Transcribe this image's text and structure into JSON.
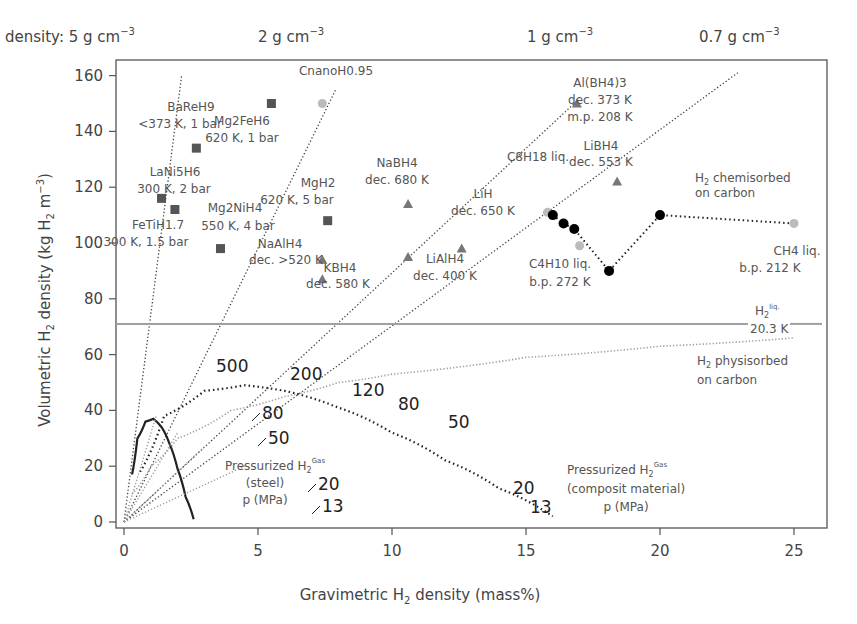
{
  "chart_data": {
    "type": "scatter",
    "title": "",
    "xlabel": "Gravimetric H2 density (mass%)",
    "ylabel": "Volumetric H2 density (kg H2 m-3)",
    "xlim": [
      0,
      26
    ],
    "ylim": [
      0,
      160
    ],
    "xticks": [
      0,
      5,
      10,
      15,
      20,
      25
    ],
    "yticks": [
      0,
      20,
      40,
      60,
      80,
      100,
      120,
      140,
      160
    ],
    "grid": false,
    "top_density_labels": [
      {
        "label": "density: 5 g cm",
        "sup": "−3",
        "x": 1.0
      },
      {
        "label": "2 g cm",
        "sup": "−3",
        "x": 7.8
      },
      {
        "label": "1 g cm",
        "sup": "−3",
        "x": 16.5
      },
      {
        "label": "0.7 g cm",
        "sup": "−3",
        "x": 23.5
      }
    ],
    "density_lines": [
      {
        "density": 5,
        "x_end": 2.15,
        "y_end": 160
      },
      {
        "density": 2,
        "x_end": 7.9,
        "y_end": 155
      },
      {
        "density": 1,
        "x_end": 16.8,
        "y_end": 150
      },
      {
        "density": 0.7,
        "x_end": 22.9,
        "y_end": 161
      }
    ],
    "series": [
      {
        "name": "Metal hydrides",
        "marker": "square",
        "color": "#555555",
        "points": [
          {
            "label": "BaReH9",
            "sub": "<373 K, 1 bar",
            "x": 2.7,
            "y": 134
          },
          {
            "label": "Mg2FeH6",
            "sub": "620 K, 1 bar",
            "x": 5.5,
            "y": 150
          },
          {
            "label": "LaNi5H6",
            "sub": "300 K, 2 bar",
            "x": 1.4,
            "y": 116
          },
          {
            "label": "FeTiH1.7",
            "sub": "300 K, 1.5 bar",
            "x": 1.9,
            "y": 112
          },
          {
            "label": "Mg2NiH4",
            "sub": "550 K, 4 bar",
            "x": 3.6,
            "y": 98
          },
          {
            "label": "MgH2",
            "sub": "620 K, 5 bar",
            "x": 7.6,
            "y": 108
          }
        ]
      },
      {
        "name": "Complex hydrides",
        "marker": "triangle",
        "color": "#777777",
        "points": [
          {
            "label": "Al(BH4)3",
            "sub": "dec. 373 K / m.p. 208 K",
            "x": 16.9,
            "y": 150
          },
          {
            "label": "LiBH4",
            "sub": "dec. 553 K",
            "x": 18.4,
            "y": 122
          },
          {
            "label": "NaBH4",
            "sub": "dec. 680 K",
            "x": 10.6,
            "y": 114
          },
          {
            "label": "LiH",
            "sub": "dec. 650 K",
            "x": 12.6,
            "y": 98
          },
          {
            "label": "LiAlH4",
            "sub": "dec. 400 K",
            "x": 10.6,
            "y": 95
          },
          {
            "label": "NaAlH4",
            "sub": "dec. >520 K",
            "x": 7.4,
            "y": 94
          },
          {
            "label": "KBH4",
            "sub": "dec. 580 K",
            "x": 7.4,
            "y": 87
          }
        ]
      },
      {
        "name": "Liquid hydrocarbons",
        "marker": "circle",
        "color": "#bbbbbb",
        "points": [
          {
            "label": "CnanoH0.95",
            "sub": "",
            "x": 7.4,
            "y": 150
          },
          {
            "label": "C8H18 liq.",
            "sub": "",
            "x": 15.8,
            "y": 111
          },
          {
            "label": "C4H10 liq.",
            "sub": "b.p. 272 K",
            "x": 17.0,
            "y": 99
          },
          {
            "label": "CH4 liq.",
            "sub": "b.p. 212 K",
            "x": 25.0,
            "y": 107
          }
        ]
      },
      {
        "name": "H2 chemisorbed on carbon",
        "marker": "circle-black",
        "color": "#000000",
        "points": [
          {
            "x": 16.0,
            "y": 110
          },
          {
            "x": 16.4,
            "y": 107
          },
          {
            "x": 16.8,
            "y": 105
          },
          {
            "x": 18.1,
            "y": 90
          },
          {
            "x": 20.0,
            "y": 110
          }
        ]
      }
    ],
    "reference_lines": [
      {
        "name": "H2 liq.",
        "sub": "20.3 K",
        "y": 71,
        "style": "solid",
        "color": "#a0a0a0"
      },
      {
        "name": "H2 physisorbed on carbon",
        "style": "dotted",
        "color": "#a0a0a0",
        "x": [
          0.3,
          1,
          2,
          4,
          6,
          8,
          10,
          15,
          20,
          25
        ],
        "y": [
          10,
          20,
          30,
          40,
          45,
          50,
          53,
          59,
          63,
          66
        ]
      }
    ],
    "pressure_curves": [
      {
        "name": "Pressurized H2 Gas (steel)",
        "unit": "p (MPa)",
        "x": [
          0.3,
          0.5,
          0.8,
          1.1,
          1.4,
          1.7,
          2.0,
          2.3,
          2.6
        ],
        "y": [
          17,
          30,
          36,
          37,
          34,
          28,
          19,
          9,
          1
        ],
        "pressure_labels": [
          "80",
          "50",
          "20",
          "13"
        ]
      },
      {
        "name": "Pressurized H2 Gas (composit material)",
        "unit": "p (MPa)",
        "x": [
          0.6,
          1.5,
          3,
          4.5,
          6,
          8,
          10,
          12,
          14,
          16
        ],
        "y": [
          18,
          38,
          47,
          49,
          47,
          41,
          32,
          22,
          12,
          2
        ],
        "pressure_labels": [
          "500",
          "200",
          "120",
          "80",
          "50",
          "20",
          "13"
        ]
      }
    ],
    "annotations": [
      "H2 chemisorbed on carbon",
      "H2 physisorbed on carbon",
      "Pressurized H2 Gas (steel) p (MPa)",
      "Pressurized H2 Gas (composit material) p (MPa)"
    ]
  },
  "labels": {
    "xlabel_pre": "Gravimetric H",
    "xlabel_sub": "2",
    "xlabel_post": " density (mass%)",
    "ylabel_pre": "Volumetric H",
    "ylabel_sub": "2",
    "ylabel_mid": " density (kg H",
    "ylabel_sub2": "2",
    "ylabel_post": " m",
    "ylabel_sup": "−3",
    "ylabel_close": ")",
    "chemisorbed_1": "H",
    "chemisorbed_sub": "2",
    "chemisorbed_2": " chemisorbed",
    "chemisorbed_3": "on carbon",
    "physisorbed_1": "H",
    "physisorbed_sub": "2",
    "physisorbed_2": " physisorbed",
    "physisorbed_3": "on carbon",
    "h2liq": "H",
    "h2liq_sub": "2",
    "h2liq_sup": "liq.",
    "h2liq_temp": "20.3 K",
    "steel_1": "Pressurized H",
    "steel_sub": "2",
    "steel_sup": "Gas",
    "steel_2": "(steel)",
    "steel_3": "p (MPa)",
    "comp_1": "Pressurized H",
    "comp_sub": "2",
    "comp_sup": "Gas",
    "comp_2": "(composit material)",
    "comp_3": "p (MPa)"
  }
}
